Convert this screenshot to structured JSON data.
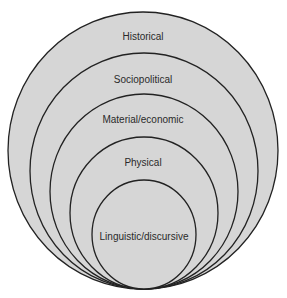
{
  "diagram": {
    "type": "nested-circles",
    "fill_color": "#d6d6d6",
    "stroke_color": "#222222",
    "layers": [
      {
        "label": "Historical"
      },
      {
        "label": "Sociopolitical"
      },
      {
        "label": "Material/economic"
      },
      {
        "label": "Physical"
      },
      {
        "label": "Linguistic/discursive"
      }
    ]
  }
}
